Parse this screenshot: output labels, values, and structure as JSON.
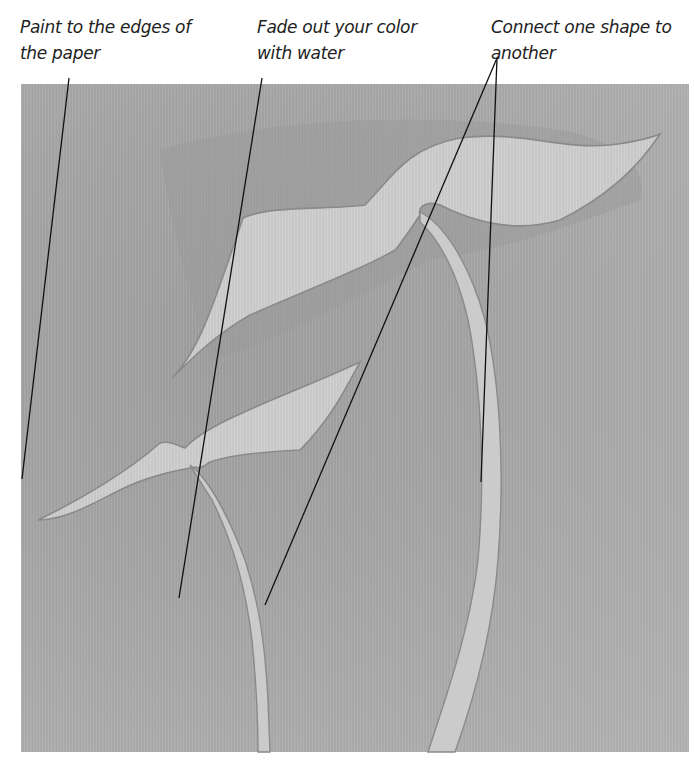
{
  "annotations": [
    {
      "id": "edges",
      "text": "Paint to the edges of the paper",
      "line1": "Paint to the edges of",
      "line2": "the paper"
    },
    {
      "id": "fade",
      "text": "Fade out your color with water",
      "line1": "Fade out your color",
      "line2": "with water"
    },
    {
      "id": "connect",
      "text": "Connect one shape to another",
      "line1": "Connect one shape to",
      "line2": "another"
    }
  ],
  "colors": {
    "background": "#ffffff",
    "paper_wash": "#a6a6a6",
    "shape_fill": "#c9c9c9",
    "shape_edge": "#8a8a8a",
    "leader_line": "#111111",
    "caption_text": "#222222"
  },
  "illustration": {
    "subject": "Watercolor wash with two light negative-space bird/leaf shapes joined by curving stems",
    "elements": [
      "upper-bird-shape",
      "lower-bird-shape",
      "left-stem",
      "right-stem"
    ]
  }
}
